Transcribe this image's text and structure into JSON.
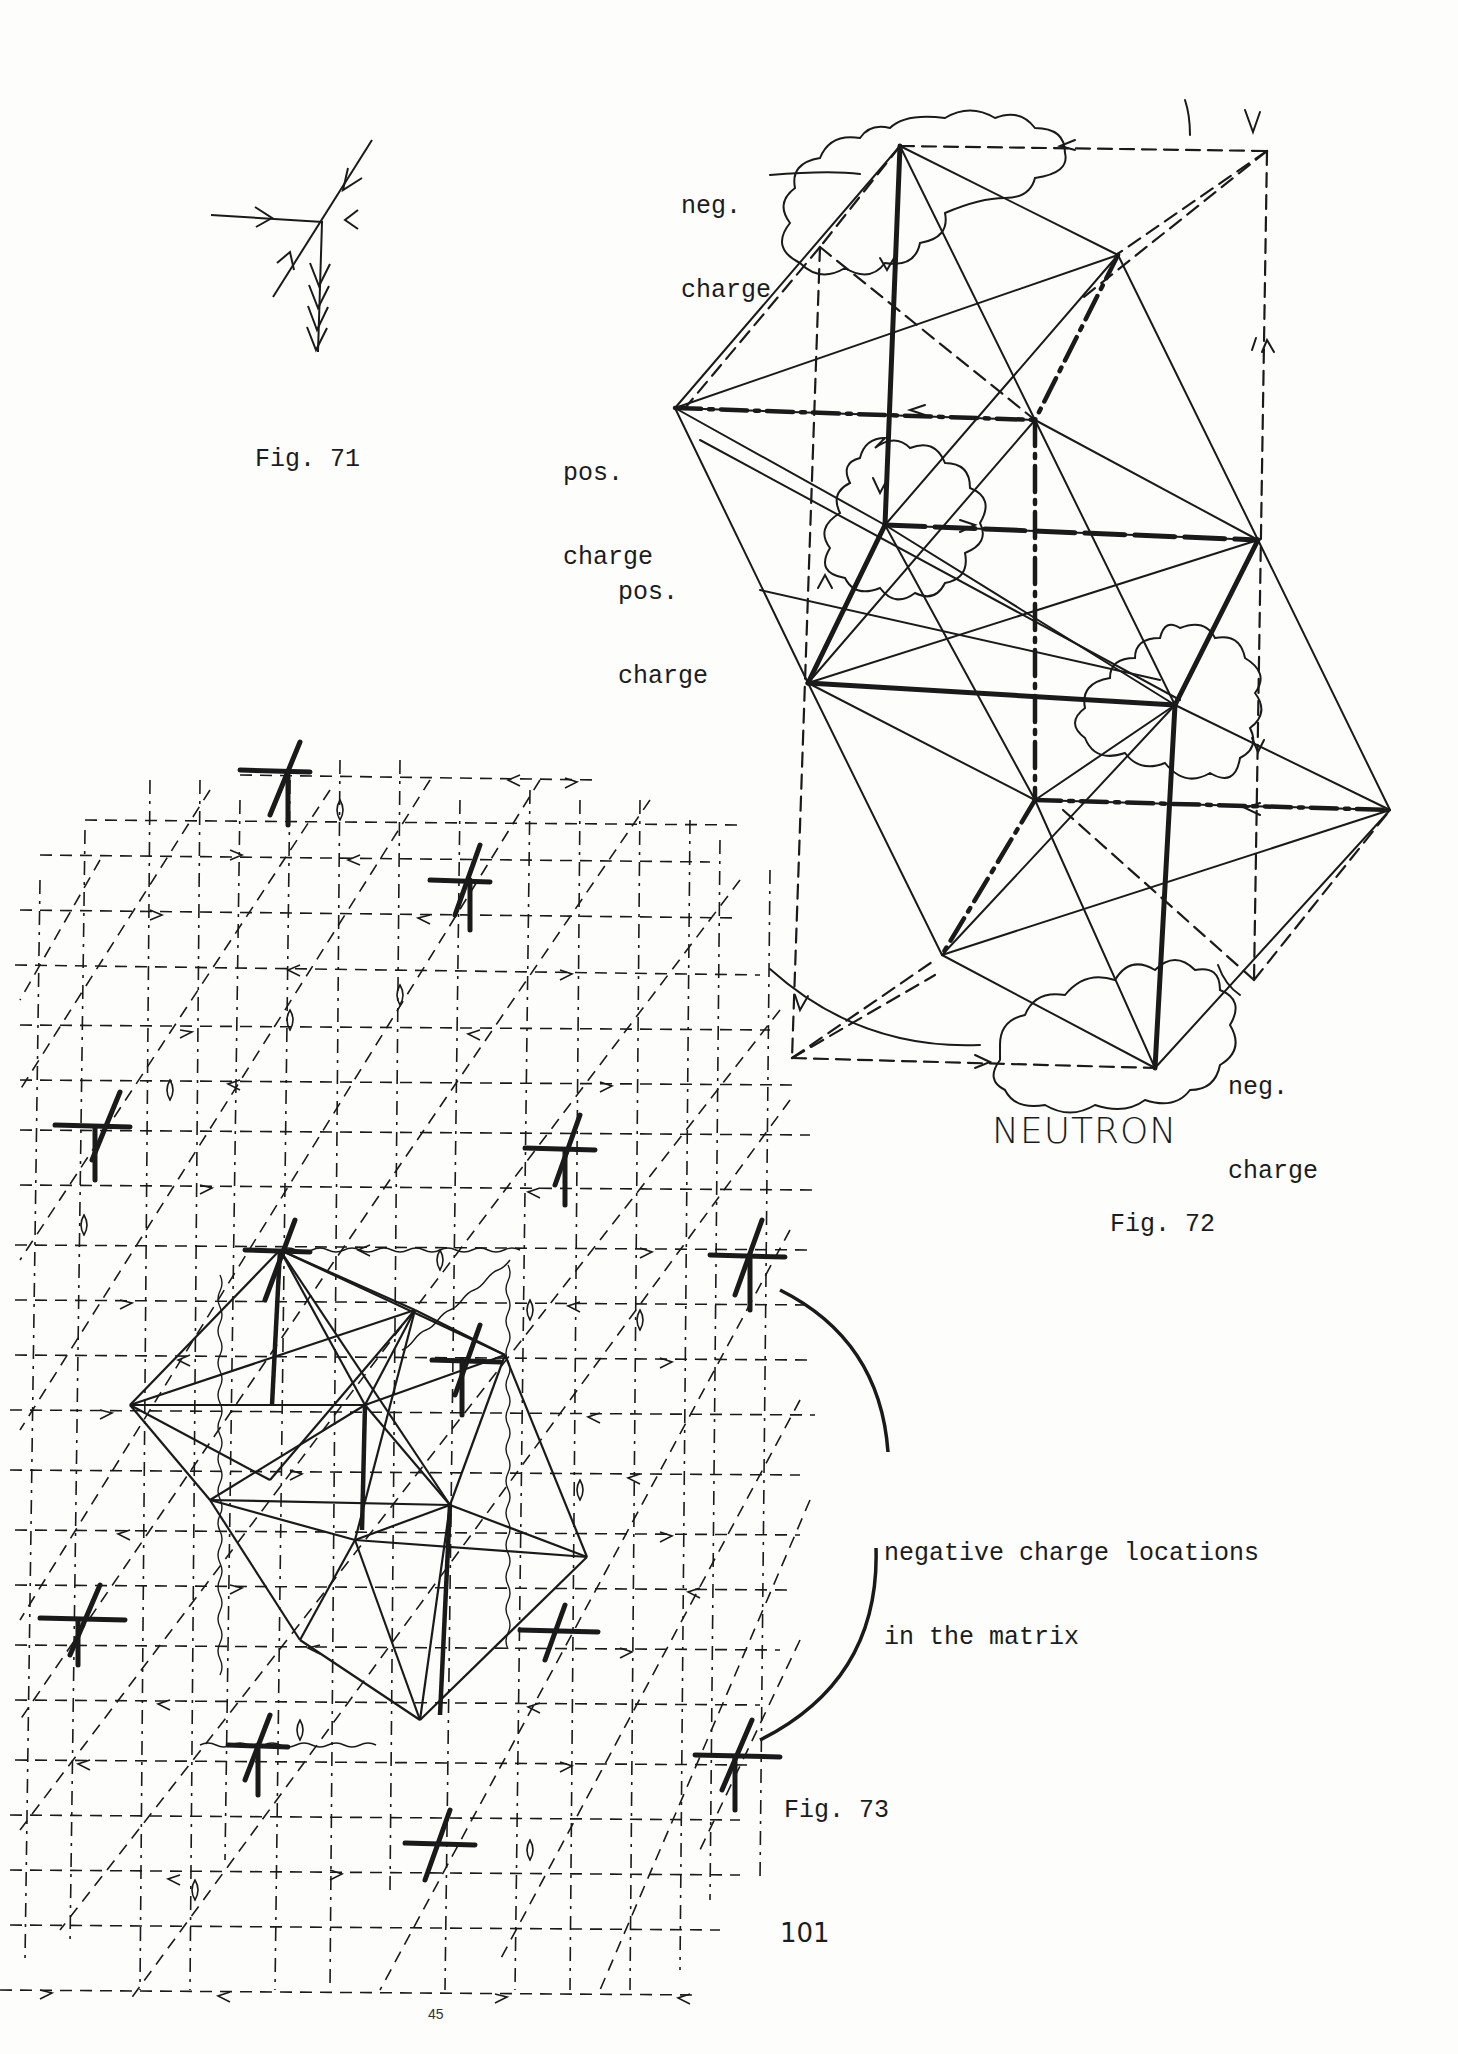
{
  "page": {
    "page_number": "101",
    "bottom_marker": "45"
  },
  "figures": [
    {
      "id": "fig71",
      "caption": "Fig. 71",
      "description": "Single lattice node with four converging arrows and a triple-headed downward arrow"
    },
    {
      "id": "fig72",
      "caption": "Fig. 72",
      "title": "NEUTRON",
      "labels": [
        {
          "line1": "neg.",
          "line2": "charge",
          "position": "top-left"
        },
        {
          "line1": "pos.",
          "line2": "charge",
          "position": "mid-left-upper"
        },
        {
          "line1": "pos.",
          "line2": "charge",
          "position": "mid-left-lower"
        },
        {
          "line1": "neg.",
          "line2": "charge",
          "position": "bottom-right"
        }
      ]
    },
    {
      "id": "fig73",
      "caption": "Fig. 73",
      "callout": {
        "line1": "negative charge locations",
        "line2": "in the matrix"
      }
    }
  ],
  "colors": {
    "ink": "#1a1a1a",
    "paper": "#fdfdfc"
  }
}
